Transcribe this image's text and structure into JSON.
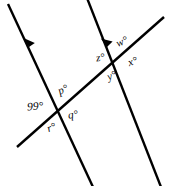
{
  "figure": {
    "type": "geometry-diagram",
    "width": 171,
    "height": 186,
    "background_color": "#ffffff",
    "stroke_color": "#000000",
    "stroke_width": 2.4
  },
  "lines": [
    {
      "id": "parallel-line-left",
      "name": "left-parallel-line",
      "x1": 8,
      "y1": 4,
      "x2": 93,
      "y2": 187,
      "has_arrow": true,
      "arrow_at": {
        "x": 29,
        "y": 46
      },
      "arrow_direction": "down-right"
    },
    {
      "id": "parallel-line-right",
      "name": "right-parallel-line",
      "x1": 87,
      "y1": -2,
      "x2": 161,
      "y2": 187,
      "has_arrow": true,
      "arrow_at": {
        "x": 107,
        "y": 46
      },
      "arrow_direction": "down-right"
    },
    {
      "id": "transversal-line",
      "name": "transversal-line",
      "x1": 17,
      "y1": 147,
      "x2": 164,
      "y2": 17,
      "has_arrow": false
    }
  ],
  "intersections": [
    {
      "id": "left-intersection",
      "x": 58,
      "y": 110
    },
    {
      "id": "right-intersection",
      "x": 115,
      "y": 58
    }
  ],
  "labels": {
    "angle_99": {
      "text": "99°",
      "x": 27,
      "y": 101,
      "vertex": "left-intersection",
      "position": "left"
    },
    "angle_p": {
      "text": "p°",
      "x": 58,
      "y": 84,
      "vertex": "left-intersection",
      "position": "top"
    },
    "angle_q": {
      "text": "q°",
      "x": 68,
      "y": 109,
      "vertex": "left-intersection",
      "position": "right"
    },
    "angle_r": {
      "text": "r°",
      "x": 47,
      "y": 122,
      "vertex": "left-intersection",
      "position": "bottom"
    },
    "angle_w": {
      "text": "w°",
      "x": 116,
      "y": 36,
      "vertex": "right-intersection",
      "position": "top-right"
    },
    "angle_z": {
      "text": "z°",
      "x": 96,
      "y": 52,
      "vertex": "right-intersection",
      "position": "top-left"
    },
    "angle_x": {
      "text": "x°",
      "x": 128,
      "y": 56,
      "vertex": "right-intersection",
      "position": "right"
    },
    "angle_y": {
      "text": "y°",
      "x": 107,
      "y": 70,
      "vertex": "right-intersection",
      "position": "bottom-left"
    }
  }
}
